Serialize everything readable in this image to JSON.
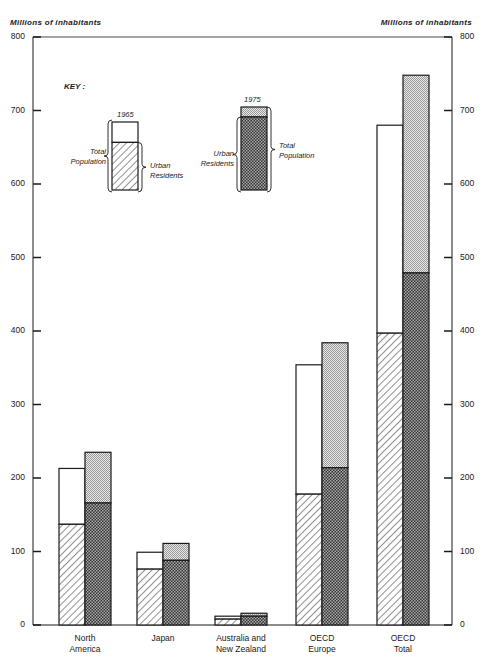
{
  "chart_data": {
    "type": "bar",
    "subtype": "grouped-stacked",
    "title": "",
    "ylabel_left": "Millions of inhabitants",
    "ylabel_right": "Millions of inhabitants",
    "xlabel": "",
    "ylim": [
      0,
      800
    ],
    "yticks": [
      0,
      100,
      200,
      300,
      400,
      500,
      600,
      700,
      800
    ],
    "grid": false,
    "categories": [
      "North America",
      "Japan",
      "Australia and New Zealand",
      "OECD Europe",
      "OECD Total"
    ],
    "category_label_lines": [
      [
        "North",
        "America"
      ],
      [
        "Japan"
      ],
      [
        "Australia and",
        "New Zealand"
      ],
      [
        "OECD",
        "Europe"
      ],
      [
        "OECD",
        "Total"
      ]
    ],
    "series": [
      {
        "name": "1965 Total Population",
        "year": "1965",
        "values": [
          213,
          99,
          12,
          354,
          680
        ]
      },
      {
        "name": "1965 Urban Residents",
        "year": "1965",
        "values": [
          137,
          76,
          8,
          178,
          397
        ]
      },
      {
        "name": "1975 Total Population",
        "year": "1975",
        "values": [
          235,
          111,
          16,
          384,
          748
        ]
      },
      {
        "name": "1975 Urban Residents",
        "year": "1975",
        "values": [
          166,
          88,
          12,
          214,
          479
        ]
      }
    ],
    "legend": {
      "title": "KEY :",
      "position": "upper-left inside plot",
      "entries": [
        {
          "year": "1965",
          "left_label": [
            "Total",
            "Population"
          ],
          "right_label": [
            "Urban",
            "Residents"
          ],
          "total": 1,
          "urban_fraction": 0.7
        },
        {
          "year": "1975",
          "left_label": [
            "Urban",
            "Residents"
          ],
          "right_label": [
            "Total",
            "Population"
          ],
          "total": 1,
          "urban_fraction": 0.88
        }
      ]
    }
  },
  "colors": {
    "ink": "#1a1a1a",
    "background": "#ffffff",
    "total_1975_fill": "#d0d0d0",
    "urban_1975_fill": "#555555"
  }
}
